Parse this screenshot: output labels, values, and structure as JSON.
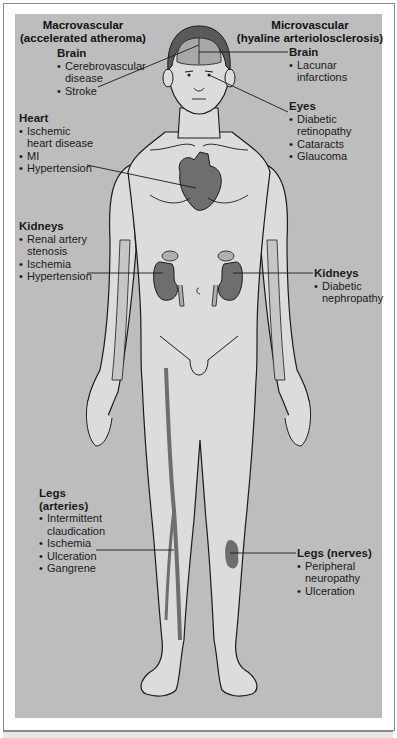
{
  "headings": {
    "left_line1": "Macrovascular",
    "left_line2": "(accelerated atheroma)",
    "right_line1": "Microvascular",
    "right_line2": "(hyaline arteriolosclerosis)"
  },
  "macrovascular": [
    {
      "title": "Brain",
      "items": [
        "Cerebrovascular disease",
        "Stroke"
      ]
    },
    {
      "title": "Heart",
      "items": [
        "Ischemic heart disease",
        "MI",
        "Hypertension"
      ]
    },
    {
      "title": "Kidneys",
      "items": [
        "Renal artery stenosis",
        "Ischemia",
        "Hypertension"
      ]
    },
    {
      "title": "Legs (arteries)",
      "items": [
        "Intermittent claudication",
        "Ischemia",
        "Ulceration",
        "Gangrene"
      ]
    }
  ],
  "microvascular": [
    {
      "title": "Brain",
      "items": [
        "Lacunar infarctions"
      ]
    },
    {
      "title": "Eyes",
      "items": [
        "Diabetic retinopathy",
        "Cataracts",
        "Glaucoma"
      ]
    },
    {
      "title": "Kidneys",
      "items": [
        "Diabetic nephropathy"
      ]
    },
    {
      "title": "Legs (nerves)",
      "items": [
        "Peripheral neuropathy",
        "Ulceration"
      ]
    }
  ],
  "colors": {
    "background_panel": "#bdbdbd",
    "body_fill": "#dcdcdc",
    "organ_fill": "#6e6e6e",
    "hair_fill": "#5a5a5a",
    "outline": "#1a1a1a"
  }
}
